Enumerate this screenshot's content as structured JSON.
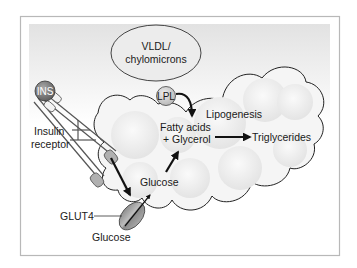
{
  "labels": {
    "vldl_line1": "VLDL/",
    "vldl_line2": "chylomicrons",
    "ins": "INS",
    "lpl": "LPL",
    "insulin_line1": "Insulin",
    "insulin_line2": "receptor",
    "lipogenesis": "Lipogenesis",
    "fatty_acids_line1": "Fatty acids",
    "fatty_acids_line2": "+ Glycerol",
    "triglycerides": "Triglycerides",
    "glucose_inside": "Glucose",
    "glut4": "GLUT4",
    "glucose_outside": "Glucose"
  },
  "colors": {
    "frame": "#b8b8b8",
    "background_top": "#e6e6e6",
    "cell_fill": "#f4f4f4",
    "cell_outline": "#222222",
    "vldl_fill": "#ececec",
    "ins_fill": "#777777",
    "lpl_fill": "#cfcfcf",
    "receptor_fill": "#b0b0b0",
    "glut4_fill": "#9a9a9a",
    "arrow": "#111111"
  }
}
